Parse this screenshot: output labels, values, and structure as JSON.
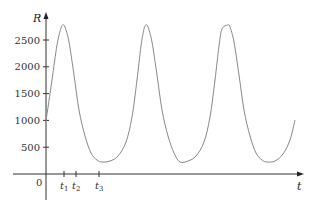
{
  "chart_data": {
    "type": "line",
    "title": "",
    "xlabel": "t",
    "ylabel": "R",
    "ylim": [
      0,
      3000
    ],
    "y_ticks": [
      500,
      1000,
      1500,
      2000,
      2500
    ],
    "y_tick_labels": [
      "500",
      "1000",
      "1500",
      "2000",
      "2500"
    ],
    "x_ticks": [
      {
        "label": "t",
        "sub": "1",
        "px": 64
      },
      {
        "label": "t",
        "sub": "2",
        "px": 76
      },
      {
        "label": "t",
        "sub": "3",
        "px": 99
      }
    ],
    "origin_label": "0",
    "grid": false,
    "legend": null,
    "series": [
      {
        "name": "R(t)",
        "description": "Periodic population oscillation with three peaks near R≈2800 and troughs near R≈225",
        "points_px": [
          [
            46,
            121
          ],
          [
            52,
            80
          ],
          [
            57,
            45
          ],
          [
            61,
            28
          ],
          [
            63,
            25
          ],
          [
            65,
            27
          ],
          [
            69,
            42
          ],
          [
            74,
            75
          ],
          [
            79,
            110
          ],
          [
            85,
            136
          ],
          [
            91,
            153
          ],
          [
            97,
            160
          ],
          [
            102,
            162
          ],
          [
            110,
            161
          ],
          [
            118,
            156
          ],
          [
            126,
            142
          ],
          [
            132,
            117
          ],
          [
            137,
            80
          ],
          [
            141,
            46
          ],
          [
            144,
            29
          ],
          [
            146,
            25
          ],
          [
            148,
            27
          ],
          [
            152,
            42
          ],
          [
            157,
            75
          ],
          [
            162,
            110
          ],
          [
            168,
            136
          ],
          [
            174,
            153
          ],
          [
            180,
            162
          ],
          [
            188,
            161
          ],
          [
            196,
            156
          ],
          [
            204,
            142
          ],
          [
            210,
            117
          ],
          [
            215,
            80
          ],
          [
            219,
            46
          ],
          [
            222,
            29
          ],
          [
            228,
            25
          ],
          [
            230,
            27
          ],
          [
            234,
            42
          ],
          [
            239,
            75
          ],
          [
            244,
            110
          ],
          [
            250,
            136
          ],
          [
            256,
            153
          ],
          [
            262,
            160
          ],
          [
            267,
            162
          ],
          [
            275,
            161
          ],
          [
            283,
            154
          ],
          [
            290,
            140
          ],
          [
            295,
            120
          ]
        ],
        "peaks": [
          {
            "t_px": 63,
            "R": 2800
          },
          {
            "t_px": 146,
            "R": 2800
          },
          {
            "t_px": 228,
            "R": 2800
          }
        ],
        "troughs": [
          {
            "t_px": 102,
            "R": 225
          },
          {
            "t_px": 180,
            "R": 225
          },
          {
            "t_px": 267,
            "R": 225
          }
        ],
        "start_R": 1000
      }
    ]
  }
}
